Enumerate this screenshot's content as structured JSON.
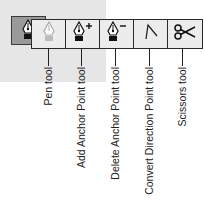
{
  "tools": [
    {
      "id": "pen",
      "icon": "pen-icon",
      "label": "Pen tool",
      "center_x": 48
    },
    {
      "id": "add-anchor",
      "icon": "pen-plus-icon",
      "label": "Add Anchor Point tool",
      "center_x": 81
    },
    {
      "id": "delete-anchor",
      "icon": "pen-minus-icon",
      "label": "Delete Anchor Point tool",
      "center_x": 115
    },
    {
      "id": "convert-direction",
      "icon": "convert-point-icon",
      "label": "Convert Direction Point tool",
      "center_x": 149
    },
    {
      "id": "scissors",
      "icon": "scissors-icon",
      "label": "Scissors tool",
      "center_x": 182
    }
  ],
  "selected_tool": {
    "icon": "pen-icon"
  },
  "colors": {
    "selected_bg": "#9a9a9a",
    "tool_bg": "#ececec",
    "panel_bg": "#e6e6e6",
    "border": "#2a2a2a"
  }
}
